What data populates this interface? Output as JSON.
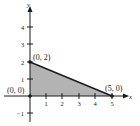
{
  "diagram": {
    "type": "feasible-region",
    "axes": {
      "x_label": "x",
      "y_label": "y"
    },
    "x_ticks": [
      "1",
      "2",
      "3",
      "4",
      "5"
    ],
    "y_ticks": [
      "4",
      "3",
      "2",
      "1",
      "−1"
    ],
    "vertices": [
      {
        "label": "(0, 0)",
        "x": 0,
        "y": 0
      },
      {
        "label": "(0, 2)",
        "x": 0,
        "y": 2
      },
      {
        "label": "(5, 0)",
        "x": 5,
        "y": 0
      }
    ],
    "fill_color": "#b0b0b0",
    "line_color": "#1a1a1a"
  }
}
